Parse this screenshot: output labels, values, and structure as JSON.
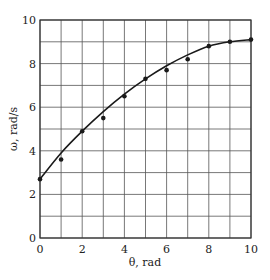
{
  "chart_data": {
    "type": "scatter",
    "title": "",
    "xlabel": "θ, rad",
    "ylabel": "ω, rad/s",
    "xlim": [
      0,
      10
    ],
    "ylim": [
      0,
      10
    ],
    "grid": true,
    "grid_step": 1,
    "x_ticks": [
      0,
      2,
      4,
      6,
      8,
      10
    ],
    "y_ticks": [
      0,
      2,
      4,
      6,
      8,
      10
    ],
    "x_tick_labels": [
      "0",
      "2",
      "4",
      "6",
      "8",
      "10"
    ],
    "y_tick_labels": [
      "0",
      "2",
      "4",
      "6",
      "8",
      "10"
    ],
    "series": [
      {
        "name": "measured",
        "type": "scatter",
        "x": [
          0,
          1,
          2,
          3,
          4,
          5,
          6,
          7,
          8,
          9,
          10
        ],
        "y": [
          2.7,
          3.6,
          4.9,
          5.5,
          6.5,
          7.3,
          7.7,
          8.2,
          8.8,
          9.0,
          9.1
        ]
      },
      {
        "name": "fit",
        "type": "line",
        "x": [
          0,
          1,
          2,
          3,
          4,
          5,
          6,
          7,
          8,
          9,
          10
        ],
        "y": [
          2.7,
          3.9,
          4.9,
          5.8,
          6.6,
          7.3,
          7.9,
          8.4,
          8.8,
          9.0,
          9.1
        ]
      }
    ],
    "legend": null
  }
}
